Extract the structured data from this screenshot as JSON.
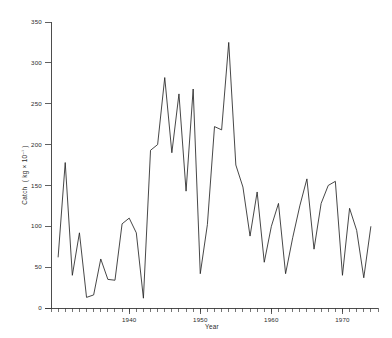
{
  "chart_data": {
    "type": "line",
    "title": "",
    "xlabel": "Year",
    "ylabel": "Catch  ( kg × 10⁻¹ )",
    "xlim": [
      1929,
      1975
    ],
    "ylim": [
      0,
      350
    ],
    "grid": false,
    "legend": "none",
    "y_ticks": [
      0,
      50,
      100,
      150,
      200,
      250,
      300,
      350
    ],
    "y_tick_labels": [
      "0",
      "50",
      "100",
      "150",
      "200",
      "250",
      "300",
      "350"
    ],
    "x_ticks": [
      1940,
      1950,
      1960,
      1970
    ],
    "x_tick_labels": [
      "1940",
      "1950",
      "1960",
      "1970"
    ],
    "x_minor_tick_interval": 1,
    "series": [
      {
        "name": "Catch",
        "x": [
          1930,
          1931,
          1932,
          1933,
          1934,
          1935,
          1936,
          1937,
          1938,
          1939,
          1940,
          1941,
          1942,
          1943,
          1944,
          1945,
          1946,
          1947,
          1948,
          1949,
          1950,
          1951,
          1952,
          1953,
          1954,
          1955,
          1956,
          1957,
          1958,
          1959,
          1960,
          1961,
          1962,
          1963,
          1964,
          1965,
          1966,
          1967,
          1968,
          1969,
          1970,
          1971,
          1972,
          1973,
          1974
        ],
        "values": [
          62,
          178,
          40,
          92,
          13,
          16,
          60,
          35,
          34,
          103,
          110,
          92,
          12,
          193,
          200,
          282,
          190,
          262,
          143,
          268,
          42,
          102,
          222,
          218,
          325,
          175,
          148,
          88,
          142,
          56,
          100,
          128,
          42,
          86,
          125,
          158,
          72,
          128,
          150,
          155,
          40,
          122,
          95,
          37,
          100
        ]
      }
    ]
  },
  "axis": {
    "x_title": "Year",
    "y_title_parts": {
      "main": "Catch",
      "units_open": "( kg × 10",
      "exponent": "−¹",
      "units_close": " )"
    }
  }
}
